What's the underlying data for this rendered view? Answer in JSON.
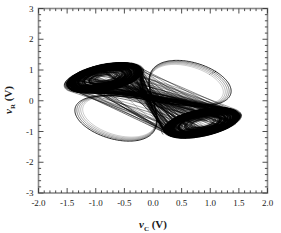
{
  "figure": {
    "background_color": "#ffffff",
    "frame_color": "#808080",
    "trace_color": "#000000"
  },
  "axes": {
    "x": {
      "label_var": "v",
      "label_sub": "C",
      "label_unit": "(V)",
      "min": -2.0,
      "max": 2.0,
      "major_step": 0.5,
      "minor_per_major": 5,
      "tick_labels": [
        "-2.0",
        "-1.5",
        "-1.0",
        "-0.5",
        "0.0",
        "0.5",
        "1.0",
        "1.5",
        "2.0"
      ],
      "tick_values": [
        -2.0,
        -1.5,
        -1.0,
        -0.5,
        0.0,
        0.5,
        1.0,
        1.5,
        2.0
      ]
    },
    "y": {
      "label_var": "v",
      "label_sub": "R",
      "label_unit": "(V)",
      "min": -3,
      "max": 3,
      "major_step": 1,
      "minor_per_major": 5,
      "tick_labels": [
        "-3",
        "-2",
        "-1",
        "0",
        "1",
        "2",
        "3"
      ],
      "tick_values": [
        -3,
        -2,
        -1,
        0,
        1,
        2,
        3
      ]
    }
  },
  "chart_data": {
    "type": "line",
    "title": "",
    "xlabel": "v_C (V)",
    "ylabel": "v_R (V)",
    "xlim": [
      -2.0,
      2.0
    ],
    "ylim": [
      -3,
      3
    ],
    "grid": false,
    "legend": "none",
    "series": [
      {
        "name": "attractor-trajectory",
        "color": "#000000",
        "line_width": 0.45,
        "style": "solid",
        "lobes": [
          {
            "name": "upper-left-lobe",
            "center": [
              -0.85,
              0.75
            ],
            "x_range": [
              -1.42,
              -0.18
            ],
            "y_range": [
              0.18,
              1.45
            ],
            "tilt_deg": 28,
            "outer_semi_major": 0.72,
            "outer_semi_minor": 0.4,
            "spiral_turns": 16
          },
          {
            "name": "lower-right-lobe",
            "center": [
              0.85,
              -0.72
            ],
            "x_range": [
              0.18,
              1.4
            ],
            "y_range": [
              -1.42,
              -0.15
            ],
            "tilt_deg": 28,
            "outer_semi_major": 0.72,
            "outer_semi_minor": 0.4,
            "spiral_turns": 16
          }
        ],
        "saddle_band": {
          "name": "connecting-band",
          "x_range": [
            -0.45,
            0.45
          ],
          "y_range": [
            -0.45,
            0.45
          ],
          "slope": 1.02
        },
        "outer_envelope": {
          "x_range": [
            -1.45,
            1.45
          ],
          "y_range": [
            -1.5,
            1.5
          ]
        },
        "trajectory_count": 120
      }
    ]
  }
}
